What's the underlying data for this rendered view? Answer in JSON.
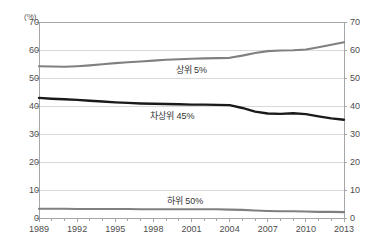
{
  "title_partial": "",
  "footnote_partial": "",
  "axis": {
    "unit_label": "(%)",
    "y_ticks": [
      "70",
      "60",
      "50",
      "40",
      "30",
      "20",
      "10",
      "0"
    ],
    "x_ticks": [
      "1989",
      "1992",
      "1995",
      "1998",
      "2001",
      "2004",
      "2007",
      "2010",
      "2013"
    ]
  },
  "series_labels": {
    "top": "상위 5%",
    "middle": "차상위 45%",
    "bottom": "하위 50%"
  },
  "colors": {
    "top_series": "#808080",
    "middle_series": "#1a1a1a",
    "bottom_series": "#808080",
    "gridline": "#d9d9d9",
    "axis": "#a6a6a6",
    "tick_text": "#4d4d4d"
  },
  "chart_data": {
    "type": "line",
    "title": "",
    "xlabel": "",
    "ylabel": "(%)",
    "ylim": [
      0,
      70
    ],
    "xlim": [
      1989,
      2013
    ],
    "grid": true,
    "legend": "inline-labels",
    "x": [
      1989,
      1990,
      1991,
      1992,
      1993,
      1994,
      1995,
      1996,
      1997,
      1998,
      1999,
      2000,
      2001,
      2002,
      2003,
      2004,
      2005,
      2006,
      2007,
      2008,
      2009,
      2010,
      2011,
      2012,
      2013
    ],
    "series": [
      {
        "name": "상위 5%",
        "values": [
          54.2,
          54.1,
          54.0,
          54.2,
          54.5,
          54.9,
          55.3,
          55.6,
          55.9,
          56.2,
          56.5,
          56.7,
          56.9,
          57.0,
          57.1,
          57.2,
          58.0,
          58.9,
          59.6,
          59.8,
          59.9,
          60.2,
          61.0,
          61.9,
          62.8
        ]
      },
      {
        "name": "차상위 45%",
        "values": [
          42.9,
          42.6,
          42.4,
          42.2,
          41.9,
          41.6,
          41.3,
          41.1,
          40.9,
          40.8,
          40.7,
          40.6,
          40.5,
          40.5,
          40.4,
          40.3,
          39.3,
          38.0,
          37.3,
          37.2,
          37.4,
          37.1,
          36.3,
          35.6,
          35.1
        ]
      },
      {
        "name": "하위 50%",
        "values": [
          3.3,
          3.3,
          3.3,
          3.2,
          3.2,
          3.2,
          3.2,
          3.2,
          3.1,
          3.1,
          3.1,
          3.1,
          3.1,
          3.1,
          3.1,
          3.0,
          2.9,
          2.7,
          2.5,
          2.4,
          2.4,
          2.3,
          2.2,
          2.2,
          2.1
        ]
      }
    ]
  }
}
